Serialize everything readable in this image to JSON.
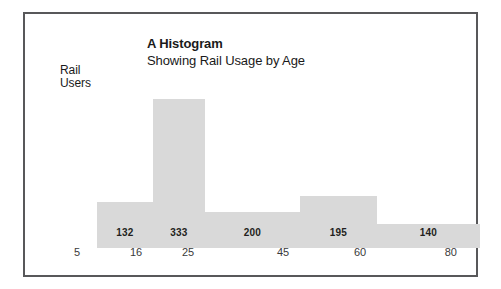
{
  "chart_data": {
    "type": "bar",
    "title": "A Histogram",
    "subtitle": "Showing Rail Usage by Age",
    "xlabel": "",
    "ylabel": "Rail Users",
    "ylabel_line1": "Rail",
    "ylabel_line2": "Users",
    "grid": false,
    "legend": "none",
    "bin_edges": [
      5,
      16,
      25,
      45,
      60,
      80
    ],
    "tick_labels": [
      "5",
      "16",
      "25",
      "45",
      "60",
      "80"
    ],
    "categories": [
      "5-16",
      "16-25",
      "25-45",
      "45-60",
      "60-80"
    ],
    "values": [
      132,
      333,
      200,
      195,
      140
    ],
    "value_labels": [
      "132",
      "333",
      "200",
      "195",
      "140"
    ],
    "xlim": [
      5,
      80
    ],
    "ylim": [
      0,
      333
    ],
    "bar_color": "#d9d9d9",
    "frame_color": "#58585a",
    "text_color": "#231f20",
    "background": "#ffffff",
    "bars": [
      {
        "label": "132",
        "value": 132,
        "x_start": 5,
        "x_end": 16,
        "left_px": 0,
        "width_px": 56,
        "height_px": 46
      },
      {
        "label": "333",
        "value": 333,
        "x_start": 16,
        "x_end": 25,
        "left_px": 56,
        "width_px": 52,
        "height_px": 149
      },
      {
        "label": "200",
        "value": 200,
        "x_start": 25,
        "x_end": 45,
        "left_px": 108,
        "width_px": 95,
        "height_px": 36
      },
      {
        "label": "195",
        "value": 195,
        "x_start": 45,
        "x_end": 60,
        "left_px": 203,
        "width_px": 77,
        "height_px": 52
      },
      {
        "label": "140",
        "value": 140,
        "x_start": 60,
        "x_end": 80,
        "left_px": 280,
        "width_px": 103,
        "height_px": 24
      }
    ],
    "xtick_positions_px": [
      72,
      128,
      180,
      275,
      352,
      455
    ]
  }
}
